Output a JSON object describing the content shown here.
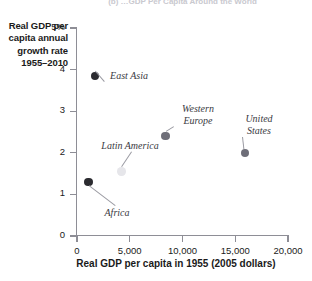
{
  "panel": {
    "caption": "(b) …GDP Per Capita Around the World"
  },
  "chart_data": {
    "type": "scatter",
    "title": "",
    "xlabel": "Real GDP per capita in 1955 (2005 dollars)",
    "ylabel": "Real GDP per capita annual growth rate 1955–2010",
    "xlim": [
      0,
      20000
    ],
    "ylim": [
      0,
      5
    ],
    "grid": false,
    "legend": "none",
    "xticks": [
      0,
      5000,
      10000,
      15000,
      20000
    ],
    "xticklabels": [
      "0",
      "5,000",
      "10,000",
      "15,000",
      "20,000"
    ],
    "yticks": [
      0,
      1,
      2,
      3,
      4,
      5
    ],
    "yticklabels": [
      "0",
      "1",
      "2",
      "3",
      "4",
      "5%"
    ],
    "points": [
      {
        "name": "East Asia",
        "x": 1700,
        "y": 3.85,
        "color": "#2b2b30",
        "radius": 4.2
      },
      {
        "name": "Africa",
        "x": 1100,
        "y": 1.3,
        "color": "#2b2b30",
        "radius": 4.2
      },
      {
        "name": "Latin America",
        "x": 4200,
        "y": 1.55,
        "color": "#e6e6ea",
        "radius": 4.2
      },
      {
        "name": "Western Europe",
        "x": 8400,
        "y": 2.4,
        "color": "#6e6e78",
        "radius": 4.2
      },
      {
        "name": "United States",
        "x": 15900,
        "y": 2.0,
        "color": "#6e6e78",
        "radius": 4.2
      }
    ]
  },
  "y_axis_title": {
    "line1": "Real GDP per",
    "line2": "capita annual",
    "line3": "growth rate",
    "line4": "1955–2010"
  },
  "point_labels": {
    "east_asia": "East Asia",
    "africa": "Africa",
    "latin_america": "Latin America",
    "western_europe": "Western\nEurope",
    "united_states": "United\nStates"
  },
  "colors": {
    "axis": "#8e8e96",
    "text": "#1a1a1a",
    "label_text": "#3a3a42",
    "leader": "#9a9aa2",
    "dot_dark": "#2b2b30",
    "dot_mid": "#6e6e78",
    "dot_light": "#e6e6ea",
    "background": "#ffffff"
  }
}
